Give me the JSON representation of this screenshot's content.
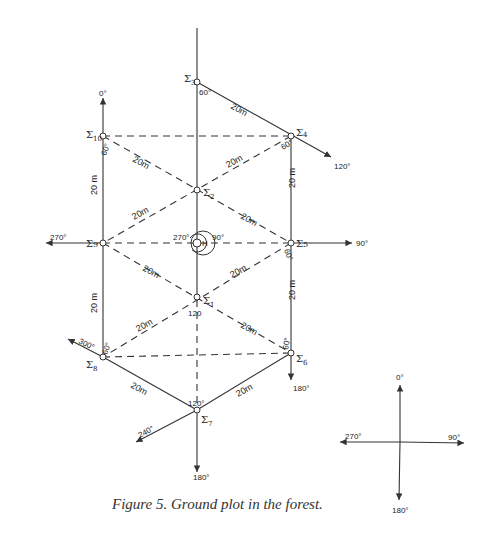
{
  "figure": {
    "caption": "Figure 5. Ground plot in the forest.",
    "center_label": "H",
    "center_angles": {
      "left": "270°",
      "right": "90°"
    },
    "stations": [
      {
        "id": "Σ1",
        "sub": "1",
        "angle_label": "120"
      },
      {
        "id": "Σ2",
        "sub": "2"
      },
      {
        "id": "Σ3",
        "sub": "3",
        "angle_label": "60°"
      },
      {
        "id": "Σ4",
        "sub": "4",
        "angle_label": "60°"
      },
      {
        "id": "Σ5",
        "sub": "5",
        "angle_label": "60°"
      },
      {
        "id": "Σ6",
        "sub": "6",
        "angle_label": "60°"
      },
      {
        "id": "Σ7",
        "sub": "7",
        "angle_label": "120°"
      },
      {
        "id": "Σ8",
        "sub": "8",
        "angle_label": "60°"
      },
      {
        "id": "Σ9",
        "sub": "9"
      },
      {
        "id": "Σ10",
        "sub": "10",
        "angle_label": "60°"
      }
    ],
    "distance_label": "20 m",
    "distance_label_short": "20m",
    "bearings": {
      "north_left": "0°",
      "west": "270°",
      "east": "90°",
      "ne_arrow": "120°",
      "nw_arrow": "300°",
      "sw_arrow": "240°",
      "south_right": "180°",
      "south_center": "180°"
    },
    "compass": {
      "north": "0°",
      "east": "90°",
      "south": "180°",
      "west": "270°"
    }
  }
}
